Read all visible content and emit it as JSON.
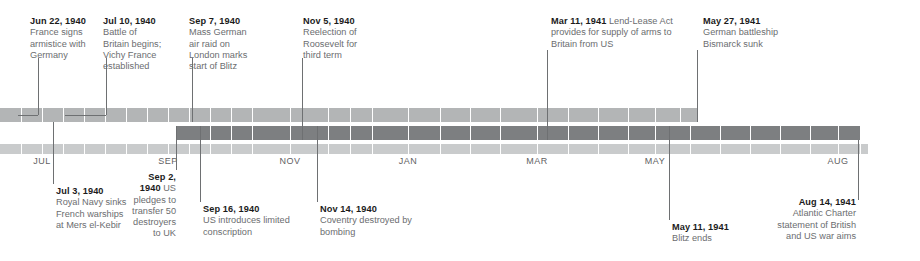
{
  "figure": {
    "kind": "timeline-diagram",
    "width": 920,
    "height": 261,
    "background": "#ffffff",
    "colors": {
      "band_upper": "#b3b5b6",
      "band_middle": "#7d7f81",
      "band_axis": "#c9cbcc",
      "segment_divider": "#ffffff",
      "leader_line": "#6e7072",
      "heading_text": "#1b1b1b",
      "body_text": "#6b6d6f",
      "tick_text": "#5f6163"
    }
  },
  "axis": {
    "type": "time",
    "tick_labels": [
      "JUL",
      "SEP",
      "NOV",
      "JAN",
      "MAR",
      "MAY",
      "AUG"
    ],
    "ticks": [
      {
        "label": "JUL",
        "x": 42
      },
      {
        "label": "SEP",
        "x": 168
      },
      {
        "label": "NOV",
        "x": 290
      },
      {
        "label": "JAN",
        "x": 408
      },
      {
        "label": "MAR",
        "x": 537
      },
      {
        "label": "MAY",
        "x": 655
      },
      {
        "label": "AUG",
        "x": 838
      }
    ]
  },
  "bands": [
    {
      "name": "band-upper",
      "color": "#b3b5b6",
      "x": 0,
      "width": 697,
      "y": 108,
      "height": 14,
      "dividers": [
        21,
        42,
        63,
        84,
        105,
        126,
        147,
        168,
        189,
        210,
        231,
        252,
        290,
        328,
        350,
        372,
        408,
        440,
        470,
        500,
        537,
        568,
        598,
        628,
        655,
        680
      ]
    },
    {
      "name": "band-middle",
      "color": "#7d7f81",
      "x": 176,
      "width": 684,
      "y": 126,
      "height": 14,
      "dividers": [
        210,
        231,
        252,
        290,
        328,
        350,
        372,
        408,
        440,
        470,
        500,
        537,
        568,
        598,
        628,
        655,
        690,
        720,
        750,
        780,
        810,
        838
      ]
    },
    {
      "name": "band-axis",
      "color": "#c9cbcc",
      "x": 0,
      "width": 868,
      "y": 144,
      "height": 10,
      "dividers": [
        21,
        42,
        63,
        84,
        105,
        126,
        147,
        168,
        189,
        210,
        231,
        252,
        290,
        328,
        350,
        372,
        408,
        440,
        470,
        500,
        537,
        568,
        598,
        628,
        655,
        690,
        720,
        750,
        780,
        810,
        838,
        860
      ]
    }
  ],
  "events_above": [
    {
      "id": "france-armistice",
      "date": "Jun 22, 1940",
      "text": "France signs armistice with Germany",
      "inline": false,
      "label_x": 30,
      "label_y": 16,
      "label_width": 62,
      "anchor_x": 18,
      "leader_x": 38,
      "leader_top": 58,
      "leader_bottom": 115,
      "elbow_y": 115
    },
    {
      "id": "battle-of-britain",
      "date": "Jul 10, 1940",
      "text": "Battle of Britain begins; Vichy France established",
      "inline": false,
      "label_x": 103,
      "label_y": 16,
      "label_width": 62,
      "anchor_x": 65,
      "leader_x": 106,
      "leader_top": 58,
      "leader_bottom": 115,
      "elbow_y": 115
    },
    {
      "id": "blitz-begins",
      "date": "Sep 7, 1940",
      "text": "Mass German air raid on London marks start of Blitz",
      "inline": false,
      "label_x": 189,
      "label_y": 16,
      "label_width": 66,
      "anchor_x": 192,
      "leader_x": 192,
      "leader_top": 58,
      "leader_bottom": 122,
      "elbow_y": null
    },
    {
      "id": "roosevelt-reelected",
      "date": "Nov 5, 1940",
      "text": "Reelection of Roosevelt for third term",
      "inline": false,
      "label_x": 303,
      "label_y": 16,
      "label_width": 66,
      "anchor_x": 302,
      "leader_x": 302,
      "leader_top": 58,
      "leader_bottom": 140,
      "elbow_y": null
    },
    {
      "id": "lend-lease",
      "date": "Mar 11, 1941",
      "text": "Lend-Lease Act provides for supply of arms to Britain from US",
      "inline": true,
      "label_x": 551,
      "label_y": 16,
      "label_width": 136,
      "anchor_x": 547,
      "leader_x": 547,
      "leader_top": 50,
      "leader_bottom": 140,
      "elbow_y": null
    },
    {
      "id": "bismarck-sunk",
      "date": "May 27, 1941",
      "text": "German battleship Bismarck sunk",
      "inline": false,
      "label_x": 703,
      "label_y": 16,
      "label_width": 98,
      "anchor_x": 697,
      "leader_x": 697,
      "leader_top": 50,
      "leader_bottom": 122,
      "elbow_y": null
    }
  ],
  "events_below": [
    {
      "id": "mers-el-kebir",
      "date": "Jul 3, 1940",
      "text": "Royal Navy sinks French warships at Mers el-Kebir",
      "inline": false,
      "align": "left",
      "label_x": 56,
      "label_y": 186,
      "label_width": 72,
      "leader_x": 53,
      "leader_top": 122,
      "leader_bottom": 184
    },
    {
      "id": "destroyers-for-bases",
      "date": "Sep 2, 1940",
      "text": "US pledges to transfer 50 destroyers to UK",
      "inline": true,
      "align": "right",
      "label_x": 132,
      "label_y": 172,
      "label_width": 44,
      "leader_x": 176,
      "leader_top": 126,
      "leader_bottom": 170
    },
    {
      "id": "limited-conscription",
      "date": "Sep 16, 1940",
      "text": "US introduces limited conscription",
      "inline": false,
      "align": "left",
      "label_x": 203,
      "label_y": 204,
      "label_width": 92,
      "leader_x": 200,
      "leader_top": 126,
      "leader_bottom": 202
    },
    {
      "id": "coventry-bombed",
      "date": "Nov 14, 1940",
      "text": "Coventry destroyed by bombing",
      "inline": false,
      "align": "left",
      "label_x": 320,
      "label_y": 204,
      "label_width": 92,
      "leader_x": 317,
      "leader_top": 126,
      "leader_bottom": 202
    },
    {
      "id": "blitz-ends",
      "date": "May 11, 1941",
      "text": "Blitz ends",
      "inline": false,
      "align": "left",
      "label_x": 672,
      "label_y": 222,
      "label_width": 80,
      "leader_x": 669,
      "leader_top": 126,
      "leader_bottom": 220
    },
    {
      "id": "atlantic-charter",
      "date": "Aug 14, 1941",
      "text": "Atlantic Charter statement of British and US war aims",
      "inline": false,
      "align": "right",
      "label_x": 764,
      "label_y": 197,
      "label_width": 92,
      "leader_x": 858,
      "leader_top": 140,
      "leader_bottom": 200
    }
  ]
}
